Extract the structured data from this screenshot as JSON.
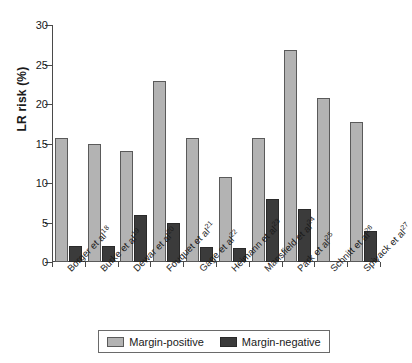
{
  "chart_data": {
    "type": "bar",
    "title": "",
    "xlabel": "",
    "ylabel": "LR risk (%)",
    "ylim": [
      0,
      30
    ],
    "yticks": [
      0,
      5,
      10,
      15,
      20,
      25,
      30
    ],
    "grid": false,
    "legend_position": "bottom",
    "categories": [
      "Borger et al",
      "Burke et al",
      "Dewar et al",
      "Fouquet et al",
      "Gage et al",
      "Heimann et al",
      "Mansfield et al",
      "Park et al",
      "Schnitt et al",
      "Spivack et al"
    ],
    "category_refs": [
      "18",
      "19",
      "20",
      "21",
      "22",
      "23",
      "24",
      "25",
      "26",
      "27"
    ],
    "series": [
      {
        "name": "Margin-positive",
        "color": "#b3b3b3",
        "values": [
          15.7,
          14.9,
          14.0,
          22.9,
          15.7,
          10.8,
          15.7,
          26.8,
          20.8,
          17.7
        ]
      },
      {
        "name": "Margin-negative",
        "color": "#3b3b3b",
        "values": [
          2.0,
          2.0,
          6.0,
          4.9,
          1.9,
          1.8,
          8.0,
          6.7,
          null,
          3.9
        ]
      }
    ]
  },
  "legend": {
    "items": [
      {
        "label": "Margin-positive",
        "swatch": "pos"
      },
      {
        "label": "Margin-negative",
        "swatch": "neg"
      }
    ]
  }
}
